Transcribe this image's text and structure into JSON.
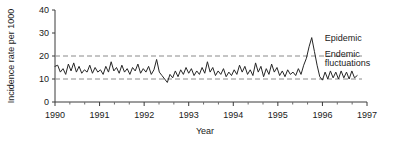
{
  "chart_data": {
    "type": "line",
    "title": "",
    "xlabel": "Year",
    "ylabel": "Incidence rate per 1000",
    "xlim": [
      1990,
      1997
    ],
    "ylim": [
      0,
      40
    ],
    "yticks": [
      0,
      10,
      20,
      30,
      40
    ],
    "ytick_labels": [
      "0",
      "10",
      "20",
      "30",
      "40"
    ],
    "xticks": [
      1990,
      1991,
      1992,
      1993,
      1994,
      1995,
      1996,
      1997
    ],
    "xtick_labels": [
      "1990",
      "1991",
      "1992",
      "1993",
      "1994",
      "1995",
      "1996",
      "1997"
    ],
    "x_minor_ticks_per_interval": 2,
    "grid": false,
    "legend": "none",
    "reference_lines": [
      {
        "name": "endemic-upper-threshold",
        "value": 20,
        "style": "dashed",
        "color": "#8a8a8a"
      },
      {
        "name": "endemic-lower-threshold",
        "value": 10,
        "style": "dashed",
        "color": "#8a8a8a"
      }
    ],
    "annotations": [
      {
        "name": "epidemic-label",
        "text": "Epidemic",
        "x": 1996.05,
        "y": 26.5
      },
      {
        "name": "endemic-label-line1",
        "text": "Endemic",
        "x": 1996.05,
        "y": 19.5
      },
      {
        "name": "endemic-label-line2",
        "text": "fluctuations",
        "x": 1996.05,
        "y": 15.5
      }
    ],
    "series": [
      {
        "name": "incidence-rate",
        "color": "#262626",
        "x": [
          1990.0,
          1990.06,
          1990.12,
          1990.18,
          1990.24,
          1990.3,
          1990.36,
          1990.42,
          1990.48,
          1990.54,
          1990.6,
          1990.66,
          1990.72,
          1990.78,
          1990.84,
          1990.9,
          1990.96,
          1991.02,
          1991.08,
          1991.14,
          1991.2,
          1991.26,
          1991.32,
          1991.38,
          1991.44,
          1991.5,
          1991.56,
          1991.62,
          1991.68,
          1991.74,
          1991.8,
          1991.86,
          1991.92,
          1991.98,
          1992.04,
          1992.1,
          1992.16,
          1992.22,
          1992.28,
          1992.34,
          1992.4,
          1992.46,
          1992.52,
          1992.58,
          1992.64,
          1992.7,
          1992.76,
          1992.82,
          1992.88,
          1992.94,
          1993.0,
          1993.06,
          1993.12,
          1993.18,
          1993.24,
          1993.3,
          1993.36,
          1993.42,
          1993.48,
          1993.54,
          1993.6,
          1993.66,
          1993.72,
          1993.78,
          1993.84,
          1993.9,
          1993.96,
          1994.02,
          1994.08,
          1994.14,
          1994.2,
          1994.26,
          1994.32,
          1994.38,
          1994.44,
          1994.5,
          1994.56,
          1994.62,
          1994.68,
          1994.74,
          1994.8,
          1994.86,
          1994.92,
          1994.98,
          1995.04,
          1995.1,
          1995.16,
          1995.22,
          1995.28,
          1995.34,
          1995.4,
          1995.46,
          1995.52,
          1995.58,
          1995.64,
          1995.7,
          1995.76,
          1995.82,
          1995.88,
          1995.94,
          1996.0,
          1996.06,
          1996.12,
          1996.18,
          1996.24,
          1996.3,
          1996.36,
          1996.42,
          1996.48,
          1996.54,
          1996.6,
          1996.66,
          1996.72,
          1996.78
        ],
        "y": [
          15.5,
          16.0,
          13.0,
          14.5,
          12.0,
          16.5,
          13.5,
          17.0,
          13.0,
          15.5,
          12.5,
          14.0,
          13.0,
          16.0,
          12.5,
          15.0,
          13.0,
          14.0,
          12.0,
          15.5,
          13.0,
          17.5,
          13.5,
          15.0,
          12.5,
          16.0,
          13.0,
          14.5,
          12.0,
          15.0,
          13.5,
          16.5,
          12.5,
          14.5,
          13.0,
          15.5,
          12.0,
          14.0,
          18.5,
          13.0,
          11.5,
          10.0,
          8.5,
          12.0,
          10.5,
          13.5,
          11.0,
          14.0,
          12.0,
          15.0,
          12.5,
          14.5,
          11.5,
          13.5,
          12.0,
          15.0,
          12.5,
          17.5,
          13.0,
          15.0,
          11.5,
          13.5,
          12.0,
          14.5,
          11.0,
          13.0,
          11.5,
          14.0,
          12.0,
          16.0,
          13.0,
          15.5,
          12.0,
          14.0,
          11.5,
          17.0,
          13.0,
          15.5,
          11.0,
          14.5,
          12.0,
          16.5,
          13.0,
          15.0,
          11.5,
          13.5,
          11.0,
          14.0,
          12.0,
          13.0,
          11.5,
          14.5,
          12.0,
          16.0,
          19.0,
          24.0,
          28.0,
          22.0,
          16.0,
          11.0,
          9.5,
          13.0,
          10.0,
          13.5,
          10.5,
          13.0,
          10.0,
          13.5,
          10.5,
          13.0,
          10.0,
          13.5,
          10.5,
          11.5
        ]
      }
    ]
  },
  "axes": {
    "y_axis_title": "Incidence rate per 1000",
    "x_axis_title": "Year"
  }
}
